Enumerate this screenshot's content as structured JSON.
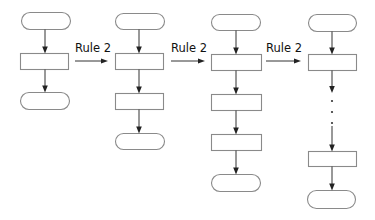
{
  "diagram": {
    "title": "",
    "stroke_color": "#333333",
    "shape_border_color": "#8a8a8a",
    "columns": [
      {
        "id": "col-1",
        "center_x": 45,
        "nodes": [
          {
            "type": "terminator",
            "x": 21,
            "y": 12,
            "w": 49,
            "h": 17
          },
          {
            "type": "process",
            "x": 20,
            "y": 53,
            "w": 48,
            "h": 16
          },
          {
            "type": "terminator",
            "x": 20,
            "y": 92,
            "w": 49,
            "h": 17
          }
        ],
        "ellipsis": false
      },
      {
        "id": "col-2",
        "center_x": 139,
        "nodes": [
          {
            "type": "terminator",
            "x": 115,
            "y": 13,
            "w": 49,
            "h": 16
          },
          {
            "type": "process",
            "x": 115,
            "y": 53,
            "w": 48,
            "h": 16
          },
          {
            "type": "process",
            "x": 115,
            "y": 93,
            "w": 48,
            "h": 16
          },
          {
            "type": "terminator",
            "x": 115,
            "y": 133,
            "w": 49,
            "h": 16
          }
        ],
        "ellipsis": false
      },
      {
        "id": "col-3",
        "center_x": 236,
        "nodes": [
          {
            "type": "terminator",
            "x": 211,
            "y": 14,
            "w": 49,
            "h": 16
          },
          {
            "type": "process",
            "x": 211,
            "y": 54,
            "w": 50,
            "h": 16
          },
          {
            "type": "process",
            "x": 211,
            "y": 94,
            "w": 50,
            "h": 16
          },
          {
            "type": "process",
            "x": 211,
            "y": 134,
            "w": 50,
            "h": 16
          },
          {
            "type": "terminator",
            "x": 211,
            "y": 174,
            "w": 49,
            "h": 17
          }
        ],
        "ellipsis": false
      },
      {
        "id": "col-4",
        "center_x": 332,
        "nodes": [
          {
            "type": "terminator",
            "x": 308,
            "y": 14,
            "w": 48,
            "h": 17
          },
          {
            "type": "process",
            "x": 308,
            "y": 54,
            "w": 48,
            "h": 16
          },
          {
            "type": "process",
            "x": 308,
            "y": 151,
            "w": 48,
            "h": 15
          },
          {
            "type": "terminator",
            "x": 307,
            "y": 190,
            "w": 48,
            "h": 18
          }
        ],
        "ellipsis": true,
        "ellipsis_after_node": 1,
        "ellipsis_dots_y": [
          101,
          112,
          123
        ]
      }
    ],
    "transitions": [
      {
        "label": "Rule 2",
        "label_x": 75,
        "label_y": 43,
        "arrow_x1": 75,
        "arrow_x2": 108,
        "arrow_y": 61
      },
      {
        "label": "Rule 2",
        "label_x": 171,
        "label_y": 43,
        "arrow_x1": 171,
        "arrow_x2": 205,
        "arrow_y": 61
      },
      {
        "label": "Rule 2",
        "label_x": 266,
        "label_y": 43,
        "arrow_x1": 266,
        "arrow_x2": 301,
        "arrow_y": 61
      }
    ]
  }
}
